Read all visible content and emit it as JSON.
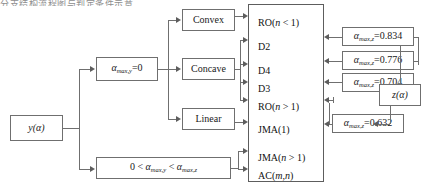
{
  "figure": {
    "clipped_header_text": "分支结构流程图与判定条件示意",
    "accent_line_color": "#6f6f6f",
    "text_color": "#111111",
    "background": "#ffffff"
  },
  "input_node": {
    "label": "y(α)",
    "name": "y-alpha-input"
  },
  "condition_nodes": [
    {
      "id": "alpha-max-y-zero",
      "label": "α max,y =0",
      "symbol": "α",
      "subscript": "max,y",
      "relation": "=0"
    },
    {
      "id": "alpha-range",
      "label": "0 < α max,y < α max,z",
      "symbol": "α",
      "relation": "range"
    }
  ],
  "shape_nodes": [
    {
      "id": "convex",
      "label": "Convex"
    },
    {
      "id": "concave",
      "label": "Concave"
    },
    {
      "id": "linear",
      "label": "Linear"
    }
  ],
  "classification_box": {
    "name": "classification-results-box",
    "entries": [
      {
        "id": "ro-n-lt-1",
        "label": "RO(n < 1)"
      },
      {
        "id": "d2",
        "label": "D2"
      },
      {
        "id": "d4",
        "label": "D4"
      },
      {
        "id": "d3",
        "label": "D3"
      },
      {
        "id": "ro-n-gt-1",
        "label": "RO(n > 1)"
      },
      {
        "id": "jma-1",
        "label": "JMA(1)"
      },
      {
        "id": "jma-n-gt-1",
        "label": "JMA(n > 1)"
      },
      {
        "id": "ac-m-n",
        "label": "AC(m,n)"
      }
    ]
  },
  "alpha_value_nodes": [
    {
      "id": "alpha-max-z-0834",
      "symbol": "α",
      "subscript": "max,z",
      "value": "0.834",
      "label": "α max,z =0.834"
    },
    {
      "id": "alpha-max-z-0776",
      "symbol": "α",
      "subscript": "max,z",
      "value": "0.776",
      "label": "α max,z =0.776"
    },
    {
      "id": "alpha-max-z-0704",
      "symbol": "α",
      "subscript": "max,z",
      "value": "0.704",
      "label": "α max,z =0.704"
    },
    {
      "id": "alpha-max-z-0632",
      "symbol": "α",
      "subscript": "max,z",
      "value": "0.632",
      "label": "α max,z =0.632"
    }
  ],
  "z_node": {
    "label": "z(α)",
    "name": "z-alpha-node"
  }
}
